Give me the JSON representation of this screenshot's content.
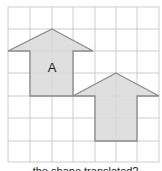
{
  "grid": {
    "columns": 7,
    "rows": 7,
    "line_color": "#cccccc"
  },
  "shapes": [
    {
      "label": "A",
      "type": "arrow-up",
      "fill": "#d9d9d9",
      "stroke": "#8a8a8a"
    },
    {
      "label": "",
      "type": "arrow-up",
      "fill": "#d9d9d9",
      "stroke": "#8a8a8a"
    }
  ],
  "caption": "...the shape translated?"
}
